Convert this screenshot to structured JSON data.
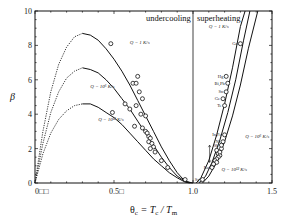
{
  "chart_data": {
    "type": "line",
    "title": "",
    "xlabel": "θc = Tc / Tm",
    "ylabel": "β",
    "xlim": [
      0,
      1.5
    ],
    "ylim": [
      0,
      10
    ],
    "x_ticks": [
      "0□□",
      "0.5□",
      "1.0",
      "1.5"
    ],
    "x_tick_values": [
      0,
      0.5,
      1.0,
      1.5
    ],
    "y_ticks": [
      "0",
      "2",
      "4",
      "6",
      "8",
      "10"
    ],
    "y_tick_values": [
      0,
      2,
      4,
      6,
      8,
      10
    ],
    "grid": false,
    "regions": [
      "undercooling",
      "superheating"
    ],
    "divider_x": 1.0,
    "series": [
      {
        "name": "Q = 1 K/s (undercooling)",
        "x": [
          0,
          0.05,
          0.1,
          0.15,
          0.2,
          0.25,
          0.3,
          0.35,
          0.4,
          0.45,
          0.5,
          0.55,
          0.6,
          0.65,
          0.7,
          0.75,
          0.8,
          0.85,
          0.9,
          0.95,
          1.0
        ],
        "values": [
          0,
          3.0,
          5.3,
          6.9,
          7.9,
          8.5,
          8.7,
          8.6,
          8.3,
          7.8,
          7.2,
          6.5,
          5.7,
          4.8,
          3.9,
          3.0,
          2.1,
          1.3,
          0.6,
          0.1,
          0
        ]
      },
      {
        "name": "Q = 10^6 K/s (undercooling)",
        "x": [
          0,
          0.05,
          0.1,
          0.15,
          0.2,
          0.25,
          0.3,
          0.35,
          0.4,
          0.45,
          0.5,
          0.55,
          0.6,
          0.65,
          0.7,
          0.75,
          0.8,
          0.85,
          0.9,
          0.95,
          0.99
        ],
        "values": [
          0,
          2.3,
          4.1,
          5.3,
          6.1,
          6.5,
          6.7,
          6.6,
          6.4,
          6.0,
          5.5,
          4.9,
          4.3,
          3.6,
          2.9,
          2.2,
          1.5,
          0.9,
          0.4,
          0.1,
          0
        ]
      },
      {
        "name": "Q = 10^12 K/s (undercooling)",
        "x": [
          0,
          0.05,
          0.1,
          0.15,
          0.2,
          0.25,
          0.3,
          0.35,
          0.4,
          0.45,
          0.5,
          0.55,
          0.6,
          0.65,
          0.7,
          0.75,
          0.8,
          0.85,
          0.9,
          0.95,
          0.98
        ],
        "values": [
          0,
          1.7,
          2.9,
          3.7,
          4.2,
          4.5,
          4.6,
          4.6,
          4.4,
          4.1,
          3.8,
          3.4,
          2.9,
          2.4,
          1.9,
          1.4,
          1.0,
          0.6,
          0.3,
          0.05,
          0
        ]
      },
      {
        "name": "Q = 1 K/s (superheating)",
        "x": [
          1.02,
          1.05,
          1.1,
          1.15,
          1.2,
          1.25,
          1.3,
          1.33
        ],
        "values": [
          0,
          0.3,
          1.3,
          2.8,
          4.6,
          6.7,
          9.1,
          10
        ]
      },
      {
        "name": "Q = 10^6 K/s (superheating)",
        "x": [
          1.04,
          1.08,
          1.12,
          1.17,
          1.22,
          1.27,
          1.32,
          1.36
        ],
        "values": [
          0,
          0.4,
          1.2,
          2.5,
          4.1,
          6.0,
          8.3,
          10
        ]
      },
      {
        "name": "Q = 10^12 K/s (superheating)",
        "x": [
          1.06,
          1.1,
          1.15,
          1.2,
          1.25,
          1.3,
          1.35,
          1.41
        ],
        "values": [
          0,
          0.4,
          1.2,
          2.4,
          3.9,
          5.7,
          7.8,
          10
        ]
      }
    ],
    "scatter_points_undercooling": [
      {
        "x": 0.48,
        "y": 8.1
      },
      {
        "x": 0.65,
        "y": 6.2
      },
      {
        "x": 0.62,
        "y": 5.8
      },
      {
        "x": 0.64,
        "y": 5.8
      },
      {
        "x": 0.66,
        "y": 5.3
      },
      {
        "x": 0.68,
        "y": 4.9
      },
      {
        "x": 0.64,
        "y": 4.5
      },
      {
        "x": 0.57,
        "y": 4.6
      },
      {
        "x": 0.6,
        "y": 4.3
      },
      {
        "x": 0.49,
        "y": 4.1
      },
      {
        "x": 0.67,
        "y": 4.0
      },
      {
        "x": 0.7,
        "y": 3.9
      },
      {
        "x": 0.63,
        "y": 3.3
      },
      {
        "x": 0.68,
        "y": 3.2
      },
      {
        "x": 0.7,
        "y": 3.0
      },
      {
        "x": 0.71,
        "y": 2.9
      },
      {
        "x": 0.72,
        "y": 2.7
      },
      {
        "x": 0.73,
        "y": 2.6
      },
      {
        "x": 0.72,
        "y": 2.4
      },
      {
        "x": 0.74,
        "y": 2.3
      },
      {
        "x": 0.75,
        "y": 2.1
      },
      {
        "x": 0.73,
        "y": 2.0
      },
      {
        "x": 0.76,
        "y": 1.8
      },
      {
        "x": 0.8,
        "y": 1.3
      },
      {
        "x": 0.84,
        "y": 0.9
      },
      {
        "x": 0.95,
        "y": 0.2
      }
    ],
    "scatter_points_superheating": [
      {
        "x": 1.3,
        "y": 8.1,
        "label": "Ga"
      },
      {
        "x": 1.21,
        "y": 6.2,
        "label": "Hg"
      },
      {
        "x": 1.22,
        "y": 5.8,
        "label": "Bi,Pb"
      },
      {
        "x": 1.21,
        "y": 5.3,
        "label": "Sn"
      },
      {
        "x": 1.19,
        "y": 4.9,
        "label": "Ge"
      },
      {
        "x": 1.2,
        "y": 4.5,
        "label": "Te"
      },
      {
        "x": 1.2,
        "y": 2.8,
        "label": "In,Fe"
      },
      {
        "x": 1.19,
        "y": 2.4,
        "label": "Ni"
      },
      {
        "x": 1.18,
        "y": 2.2,
        "label": "Sb"
      },
      {
        "x": 1.12,
        "y": 0.9,
        "label": "Ru"
      },
      {
        "x": 1.06,
        "y": 0.2,
        "label": "Sg"
      }
    ],
    "scatter_cluster_superheating": [
      {
        "x": 1.15,
        "y": 1.9
      },
      {
        "x": 1.16,
        "y": 1.7
      },
      {
        "x": 1.17,
        "y": 1.6
      },
      {
        "x": 1.16,
        "y": 1.5
      },
      {
        "x": 1.15,
        "y": 1.4
      },
      {
        "x": 1.14,
        "y": 1.3
      },
      {
        "x": 1.15,
        "y": 1.2
      },
      {
        "x": 1.13,
        "y": 1.1
      },
      {
        "x": 1.17,
        "y": 1.8
      },
      {
        "x": 1.18,
        "y": 2.0
      }
    ],
    "annotations": [
      {
        "text": "Q = 1 K/s",
        "x": 0.6,
        "y": 8.1,
        "region": "undercooling"
      },
      {
        "text": "Q = 10⁶ K/s",
        "x": 0.35,
        "y": 5.5,
        "region": "undercooling"
      },
      {
        "text": "Q = 10¹² K/s",
        "x": 0.4,
        "y": 3.6,
        "region": "undercooling"
      },
      {
        "text": "Q = 1 K/s",
        "x": 1.1,
        "y": 9.0,
        "region": "superheating"
      },
      {
        "text": "Q = 10⁶ K/s",
        "x": 1.33,
        "y": 2.6,
        "region": "superheating"
      },
      {
        "text": "Q = 10¹² K/s",
        "x": 1.18,
        "y": 0.7,
        "region": "superheating"
      }
    ]
  },
  "labels": {
    "undercooling": "undercooling",
    "superheating": "superheating",
    "ylabel": "β",
    "xlabel_theta": "θ",
    "xlabel_sub": "c",
    "xlabel_rest": " = T",
    "xlabel_c": "c",
    "xlabel_slash": " / T",
    "xlabel_m": "m",
    "x_ticks": [
      "0□□",
      "0.5□",
      "1.0",
      "1.5"
    ],
    "y_ticks": [
      "0",
      "2",
      "4",
      "6",
      "8",
      "10"
    ],
    "q1_left": "Q = 1 K/s",
    "q6_left": "Q = 10⁶ K/s",
    "q12_left": "Q = 10¹² K/s",
    "q1_right": "Q = 1 K/s",
    "q6_right": "Q = 10⁶ K/s",
    "q12_right": "Q = 10¹² K/s",
    "elements": [
      "Ga",
      "Hg",
      "Bi,Pb",
      "Sn",
      "Ge",
      "Te",
      "In,Fe",
      "Ni",
      "Sb",
      "Ru",
      "Sg"
    ]
  }
}
